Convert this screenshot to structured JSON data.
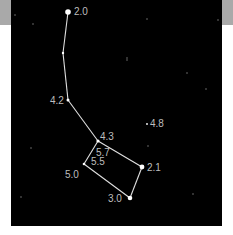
{
  "chart": {
    "title": "",
    "colors": {
      "sky": "#000000",
      "line": "#e0e0e0",
      "star": "#ffffff",
      "label": "#bdbdbd",
      "margin_strip": "#a9a9a9"
    },
    "stars": [
      {
        "id": "s1",
        "x": 68,
        "y": 12,
        "r": 2.8,
        "label": "2.0",
        "lx": 74,
        "ly": 15
      },
      {
        "id": "s2",
        "x": 63,
        "y": 53,
        "r": 1.2,
        "label": "",
        "lx": 0,
        "ly": 0
      },
      {
        "id": "s3",
        "x": 68,
        "y": 100,
        "r": 1.5,
        "label": "4.2",
        "lx": 50,
        "ly": 104
      },
      {
        "id": "s4",
        "x": 98,
        "y": 141,
        "r": 1.6,
        "label": "4.3",
        "lx": 100,
        "ly": 140
      },
      {
        "id": "s5",
        "x": 84,
        "y": 164,
        "r": 1.3,
        "label": "5.0",
        "lx": 65,
        "ly": 178
      },
      {
        "id": "s6",
        "x": 142,
        "y": 167,
        "r": 2.4,
        "label": "2.1",
        "lx": 147,
        "ly": 171
      },
      {
        "id": "s7",
        "x": 130,
        "y": 198,
        "r": 2.3,
        "label": "3.0",
        "lx": 108,
        "ly": 202
      },
      {
        "id": "s8",
        "x": 147,
        "y": 124,
        "r": 0.9,
        "label": "4.8",
        "lx": 150,
        "ly": 127
      }
    ],
    "inner_labels": [
      {
        "text": "5.7",
        "x": 96,
        "y": 156
      },
      {
        "text": "5.5",
        "x": 91,
        "y": 165
      }
    ],
    "lines": [
      [
        "s1",
        "s2"
      ],
      [
        "s2",
        "s3"
      ],
      [
        "s3",
        "s4"
      ],
      [
        "s4",
        "s6"
      ],
      [
        "s6",
        "s7"
      ],
      [
        "s7",
        "s5"
      ],
      [
        "s5",
        "s4"
      ]
    ],
    "background_stars": [
      {
        "x": 15,
        "y": 15
      },
      {
        "x": 33,
        "y": 24
      },
      {
        "x": 147,
        "y": 19
      },
      {
        "x": 218,
        "y": 20
      },
      {
        "x": 127,
        "y": 58
      },
      {
        "x": 187,
        "y": 73
      },
      {
        "x": 206,
        "y": 89
      },
      {
        "x": 31,
        "y": 148
      },
      {
        "x": 148,
        "y": 146
      },
      {
        "x": 21,
        "y": 197
      },
      {
        "x": 193,
        "y": 194
      },
      {
        "x": 127,
        "y": 60
      }
    ]
  }
}
